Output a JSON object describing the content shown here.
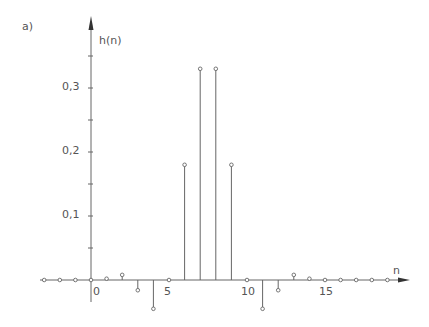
{
  "chart_data": {
    "type": "stem",
    "panel_label": "a)",
    "title": "",
    "xlabel": "n",
    "ylabel": "h(n)",
    "x_ticks": [
      0,
      5,
      10,
      15
    ],
    "y_ticks": [
      "0,1",
      "0,2",
      "0,3"
    ],
    "y_tick_values": [
      0.1,
      0.2,
      0.3
    ],
    "xlim": [
      -3,
      20
    ],
    "ylim": [
      -0.05,
      0.37
    ],
    "grid": false,
    "x": [
      -3,
      -2,
      -1,
      0,
      1,
      2,
      3,
      4,
      5,
      6,
      7,
      8,
      9,
      10,
      11,
      12,
      13,
      14,
      15,
      16,
      17,
      18,
      19
    ],
    "values": [
      0,
      0,
      0,
      0,
      0.002,
      0.008,
      -0.016,
      -0.045,
      0,
      0.18,
      0.33,
      0.33,
      0.18,
      0,
      -0.045,
      -0.016,
      0.008,
      0.002,
      0,
      0,
      0,
      0,
      0
    ]
  },
  "labels": {
    "panel": "a)",
    "ylabel": "h(n)",
    "xlabel": "n",
    "x0": "0",
    "x5": "5",
    "x10": "10",
    "x15": "15",
    "y1": "0,1",
    "y2": "0,2",
    "y3": "0,3"
  },
  "colors": {
    "ink": "#666666"
  }
}
